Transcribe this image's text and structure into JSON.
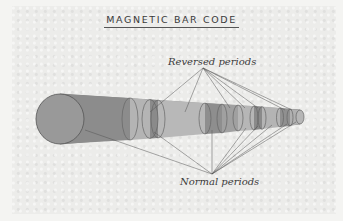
{
  "title": "MAGNETIC BAR CODE",
  "labels": {
    "reversed": "Reversed periods",
    "normal": "Normal periods"
  },
  "colors": {
    "background": "#ececea",
    "cylinder_dark": "#8e8e8e",
    "cylinder_light": "#b2b2b2",
    "lines": "#555555",
    "text": "#3a3a3a"
  }
}
